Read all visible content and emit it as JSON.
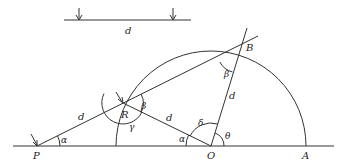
{
  "diagram": {
    "colors": {
      "stroke": "#333333",
      "text": "#222222",
      "background": "#ffffff"
    },
    "ruler": {
      "label": "d",
      "marks": 2
    },
    "points": {
      "P": {
        "label": "P",
        "x": 37,
        "y": 146
      },
      "R": {
        "label": "R",
        "x": 123,
        "y": 103
      },
      "O": {
        "label": "O",
        "x": 211,
        "y": 146
      },
      "A": {
        "label": "A",
        "x": 306,
        "y": 146
      },
      "B": {
        "label": "B",
        "x": 238,
        "y": 53
      }
    },
    "segments": {
      "PR": {
        "label": "d"
      },
      "RO": {
        "label": "d"
      },
      "OB": {
        "label": "d"
      }
    },
    "angles": {
      "alpha_P": {
        "label": "α"
      },
      "alpha_O": {
        "label": "α"
      },
      "beta_R": {
        "label": "β"
      },
      "beta_B": {
        "label": "β"
      },
      "gamma_R": {
        "label": "γ"
      },
      "delta_O": {
        "label": "δ"
      },
      "theta_O": {
        "label": "θ"
      }
    }
  }
}
